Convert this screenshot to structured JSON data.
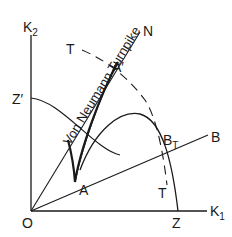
{
  "diagram": {
    "title": "Von Neumann Turnpike",
    "axes": {
      "y_label": "K",
      "y_sub": "2",
      "x_label": "K",
      "x_sub": "1",
      "origin_label": "O"
    },
    "points": {
      "z": "Z",
      "z_prime": "Z′",
      "a": "A",
      "a_prime": "A′",
      "b_t": "B",
      "b_t_sub": "T"
    },
    "rays": {
      "turnpike_label": "Von Neumann Turnpike",
      "turnpike_end": "N",
      "b_end": "B"
    },
    "dashed_curve": {
      "label_top": "T",
      "label_bottom": "T"
    },
    "colors": {
      "line": "#1a1a1a",
      "background": "#ffffff"
    }
  }
}
